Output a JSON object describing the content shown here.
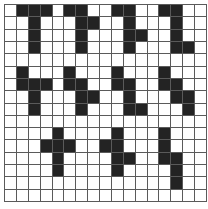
{
  "grid": {
    "columns": 17,
    "rows": 16,
    "fill_color": "#232323",
    "line_color": "#5a5a5a",
    "background_color": "#ffffff"
  },
  "shapes": [
    {
      "name": "shape-1",
      "cells": [
        [
          0,
          1
        ],
        [
          0,
          2
        ],
        [
          0,
          3
        ],
        [
          1,
          2
        ],
        [
          2,
          2
        ],
        [
          3,
          2
        ]
      ]
    },
    {
      "name": "shape-2",
      "cells": [
        [
          0,
          5
        ],
        [
          0,
          6
        ],
        [
          1,
          6
        ],
        [
          1,
          7
        ],
        [
          2,
          6
        ],
        [
          3,
          6
        ]
      ]
    },
    {
      "name": "shape-3",
      "cells": [
        [
          0,
          9
        ],
        [
          0,
          10
        ],
        [
          1,
          10
        ],
        [
          2,
          10
        ],
        [
          2,
          11
        ],
        [
          3,
          10
        ]
      ]
    },
    {
      "name": "shape-4",
      "cells": [
        [
          0,
          13
        ],
        [
          0,
          14
        ],
        [
          1,
          14
        ],
        [
          2,
          14
        ],
        [
          3,
          14
        ],
        [
          3,
          15
        ]
      ]
    },
    {
      "name": "shape-5",
      "cells": [
        [
          5,
          1
        ],
        [
          6,
          1
        ],
        [
          6,
          2
        ],
        [
          6,
          3
        ],
        [
          7,
          2
        ],
        [
          8,
          2
        ]
      ]
    },
    {
      "name": "shape-6",
      "cells": [
        [
          5,
          5
        ],
        [
          6,
          5
        ],
        [
          6,
          6
        ],
        [
          7,
          6
        ],
        [
          7,
          7
        ],
        [
          8,
          6
        ]
      ]
    },
    {
      "name": "shape-7",
      "cells": [
        [
          5,
          9
        ],
        [
          6,
          9
        ],
        [
          6,
          10
        ],
        [
          7,
          10
        ],
        [
          8,
          10
        ],
        [
          8,
          11
        ]
      ]
    },
    {
      "name": "shape-8",
      "cells": [
        [
          5,
          13
        ],
        [
          6,
          13
        ],
        [
          6,
          14
        ],
        [
          7,
          14
        ],
        [
          7,
          15
        ],
        [
          8,
          15
        ]
      ]
    },
    {
      "name": "shape-9",
      "cells": [
        [
          10,
          4
        ],
        [
          11,
          3
        ],
        [
          11,
          4
        ],
        [
          11,
          5
        ],
        [
          12,
          4
        ],
        [
          13,
          4
        ]
      ]
    },
    {
      "name": "shape-10",
      "cells": [
        [
          10,
          9
        ],
        [
          11,
          8
        ],
        [
          11,
          9
        ],
        [
          12,
          9
        ],
        [
          12,
          10
        ],
        [
          13,
          9
        ]
      ]
    },
    {
      "name": "shape-11",
      "cells": [
        [
          10,
          13
        ],
        [
          11,
          13
        ],
        [
          12,
          13
        ],
        [
          12,
          14
        ],
        [
          13,
          14
        ],
        [
          14,
          14
        ]
      ]
    }
  ]
}
